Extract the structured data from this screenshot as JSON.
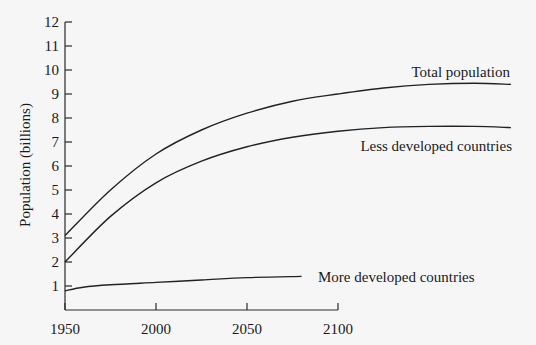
{
  "chart_data": {
    "type": "line",
    "title": "",
    "xlabel": "",
    "ylabel": "Population (billions)",
    "xlim": [
      1950,
      2100
    ],
    "ylim": [
      0,
      12
    ],
    "grid": false,
    "legend_position": "inline labels at right end of each curve",
    "x_ticks": [
      1950,
      2000,
      2050,
      2100
    ],
    "x_tick_labels": [
      "1950",
      "2000",
      "2050",
      "2100"
    ],
    "y_ticks": [
      1,
      2,
      3,
      4,
      5,
      6,
      7,
      8,
      9,
      10,
      11,
      12
    ],
    "y_tick_labels": [
      "1",
      "2",
      "3",
      "4",
      "5",
      "6",
      "7",
      "8",
      "9",
      "10",
      "11",
      "12"
    ],
    "series": [
      {
        "name": "Total population",
        "x": [
          1950,
          1975,
          2000,
          2025,
          2050,
          2075,
          2100,
          2125,
          2150,
          2175,
          2195
        ],
        "values": [
          3.1,
          5.0,
          6.5,
          7.5,
          8.2,
          8.7,
          9.0,
          9.25,
          9.4,
          9.45,
          9.4
        ]
      },
      {
        "name": "Less developed countries",
        "x": [
          1950,
          1975,
          2000,
          2025,
          2050,
          2075,
          2100,
          2125,
          2150,
          2175,
          2195
        ],
        "values": [
          2.0,
          3.9,
          5.3,
          6.2,
          6.8,
          7.2,
          7.45,
          7.6,
          7.65,
          7.65,
          7.6
        ]
      },
      {
        "name": "More developed countries",
        "x": [
          1950,
          1960,
          1975,
          2000,
          2025,
          2050,
          2080
        ],
        "values": [
          0.8,
          0.95,
          1.05,
          1.15,
          1.25,
          1.35,
          1.4
        ]
      }
    ]
  },
  "labels": {
    "y_axis_title": "Population (billions)",
    "series_total": "Total population",
    "series_less": "Less developed countries",
    "series_more": "More developed countries"
  }
}
